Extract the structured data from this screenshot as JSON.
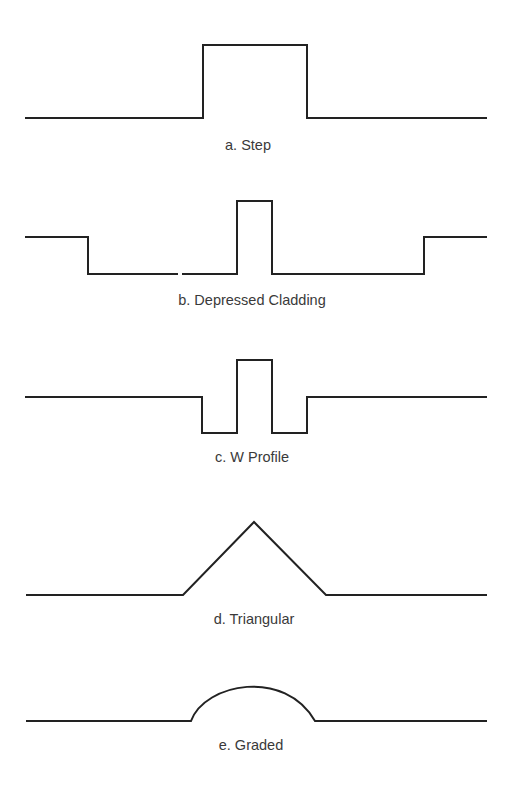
{
  "figure": {
    "stroke_color": "#222222",
    "caption_color": "#3a3a3a",
    "background": "#ffffff",
    "profiles": [
      {
        "id": "step",
        "label": "a. Step",
        "label_pos": [
          248,
          150
        ],
        "path": "M25 118 L203 118 L203 45 L307 45 L307 118 L487 118"
      },
      {
        "id": "depressed-cladding",
        "label": "b. Depressed Cladding",
        "label_pos": [
          252,
          305
        ],
        "path": "M25 237 L88 237 L88 274 L178 274 M182 274 L237 274 L237 201 L272 201 L272 274 L424 274 L424 237 L487 237"
      },
      {
        "id": "w-profile",
        "label": "c. W Profile",
        "label_pos": [
          252,
          462
        ],
        "path": "M25 397 L202 397 L202 433 L237 433 L237 360 L272 360 L272 433 L307 433 L307 397 L487 397"
      },
      {
        "id": "triangular",
        "label": "d. Triangular",
        "label_pos": [
          254,
          624
        ],
        "path": "M26 595 L183 595 L254 522 L326 595 L487 595"
      },
      {
        "id": "graded",
        "label": "e. Graded",
        "label_pos": [
          251,
          750
        ],
        "path": "M26 721 L191 721 C 205 683, 285 668, 315 721 L487 721"
      }
    ]
  }
}
